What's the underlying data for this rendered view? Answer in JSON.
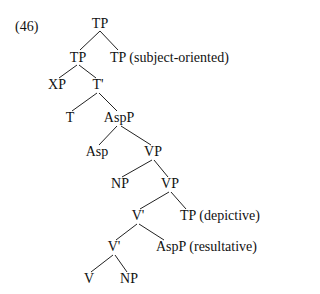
{
  "example_number": "(46)",
  "tree": {
    "nodes": [
      {
        "id": "n0",
        "label": "TP",
        "x": 100,
        "y": 22
      },
      {
        "id": "n1",
        "label": "TP",
        "x": 78,
        "y": 56
      },
      {
        "id": "n2",
        "label": "TP",
        "x": 120,
        "y": 56,
        "annotation": "(subject-oriented)"
      },
      {
        "id": "n3",
        "label": "XP",
        "x": 57,
        "y": 84
      },
      {
        "id": "n4",
        "label": "T'",
        "x": 98,
        "y": 84
      },
      {
        "id": "n5",
        "label": "T",
        "x": 70,
        "y": 117
      },
      {
        "id": "n6",
        "label": "AspP",
        "x": 119,
        "y": 117
      },
      {
        "id": "n7",
        "label": "Asp",
        "x": 97,
        "y": 151
      },
      {
        "id": "n8",
        "label": "VP",
        "x": 153,
        "y": 151
      },
      {
        "id": "n9",
        "label": "NP",
        "x": 120,
        "y": 183
      },
      {
        "id": "n10",
        "label": "VP",
        "x": 170,
        "y": 183
      },
      {
        "id": "n11",
        "label": "V'",
        "x": 138,
        "y": 215
      },
      {
        "id": "n12",
        "label": "TP",
        "x": 190,
        "y": 215,
        "annotation": "(depictive)"
      },
      {
        "id": "n13",
        "label": "V'",
        "x": 114,
        "y": 246
      },
      {
        "id": "n14",
        "label": "AspP",
        "x": 169,
        "y": 246,
        "annotation": "(resultative)"
      },
      {
        "id": "n15",
        "label": "V",
        "x": 89,
        "y": 278
      },
      {
        "id": "n16",
        "label": "NP",
        "x": 129,
        "y": 278
      }
    ],
    "edges": [
      [
        "n0",
        "n1"
      ],
      [
        "n0",
        "n2"
      ],
      [
        "n1",
        "n3"
      ],
      [
        "n1",
        "n4"
      ],
      [
        "n4",
        "n5"
      ],
      [
        "n4",
        "n6"
      ],
      [
        "n6",
        "n7"
      ],
      [
        "n6",
        "n8"
      ],
      [
        "n8",
        "n9"
      ],
      [
        "n8",
        "n10"
      ],
      [
        "n10",
        "n11"
      ],
      [
        "n10",
        "n12"
      ],
      [
        "n11",
        "n13"
      ],
      [
        "n11",
        "n14"
      ],
      [
        "n13",
        "n15"
      ],
      [
        "n13",
        "n16"
      ]
    ]
  }
}
